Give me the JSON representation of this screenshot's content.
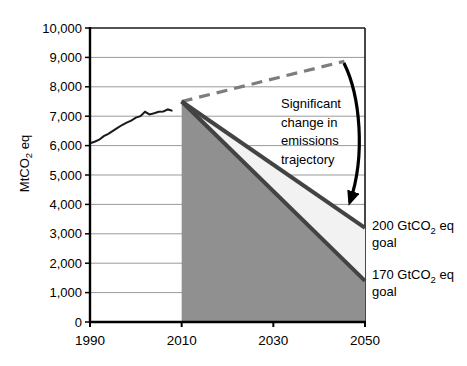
{
  "chart_data": {
    "type": "line",
    "title": "",
    "xlabel": "",
    "ylabel": "MtCO2 eq",
    "xlim": [
      1990,
      2050
    ],
    "ylim": [
      0,
      10000
    ],
    "x_ticks": [
      1990,
      2010,
      2030,
      2050
    ],
    "y_tick_step": 1000,
    "grid": true,
    "legend": "none",
    "series": [
      {
        "name": "historical-emissions",
        "style": "solid",
        "color": "#1a1a1a",
        "width": 2,
        "points": [
          [
            1990,
            6080
          ],
          [
            1991,
            6130
          ],
          [
            1992,
            6200
          ],
          [
            1993,
            6320
          ],
          [
            1994,
            6400
          ],
          [
            1995,
            6500
          ],
          [
            1996,
            6600
          ],
          [
            1997,
            6700
          ],
          [
            1998,
            6780
          ],
          [
            1999,
            6850
          ],
          [
            2000,
            6950
          ],
          [
            2001,
            7000
          ],
          [
            2002,
            7150
          ],
          [
            2003,
            7060
          ],
          [
            2004,
            7100
          ],
          [
            2005,
            7150
          ],
          [
            2006,
            7160
          ],
          [
            2007,
            7230
          ],
          [
            2008,
            7180
          ]
        ]
      },
      {
        "name": "business-as-usual-projection",
        "style": "dashed",
        "color": "#7d7d7d",
        "width": 3.2,
        "points": [
          [
            2010,
            7500
          ],
          [
            2045.5,
            8870
          ]
        ]
      },
      {
        "name": "200-gt-goal-trajectory",
        "style": "solid",
        "color": "#434343",
        "width": 4,
        "points": [
          [
            2010,
            7500
          ],
          [
            2050,
            3200
          ]
        ]
      },
      {
        "name": "170-gt-goal-trajectory",
        "style": "solid",
        "color": "#434343",
        "width": 4,
        "points": [
          [
            2010,
            7500
          ],
          [
            2050,
            1400
          ]
        ]
      }
    ],
    "areas": [
      {
        "name": "reduction-wedge-area",
        "fill": "#909090",
        "points": [
          [
            2010,
            7500
          ],
          [
            2050,
            1400
          ],
          [
            2050,
            0
          ],
          [
            2010,
            0
          ]
        ]
      },
      {
        "name": "goal-band-area",
        "fill": "#f2f2f2",
        "points": [
          [
            2010,
            7500
          ],
          [
            2050,
            3200
          ],
          [
            2050,
            1400
          ]
        ]
      }
    ],
    "arrow": {
      "start": [
        2045.4,
        8810
      ],
      "control1": [
        2048.9,
        7720
      ],
      "control2": [
        2050.2,
        5680
      ],
      "end": [
        2046.7,
        4080
      ],
      "color": "#000000",
      "width": 3.2
    }
  },
  "annotations": {
    "y_axis_title": {
      "prefix": "MtCO",
      "subscript": "2",
      "suffix": " eq"
    },
    "trajectory_note": {
      "lines": [
        "Significant",
        "change in",
        "emissions",
        "trajectory"
      ]
    },
    "goal_200": {
      "prefix": "200 GtCO",
      "subscript": "2",
      "suffix": " eq",
      "line2": "goal"
    },
    "goal_170": {
      "prefix": "170 GtCO",
      "subscript": "2",
      "suffix": " eq",
      "line2": "goal"
    }
  },
  "colors": {
    "axis": "#000000",
    "grid": "#9a9a9a",
    "border": "#1a1a1a",
    "text": "#000000",
    "background": "#ffffff"
  }
}
